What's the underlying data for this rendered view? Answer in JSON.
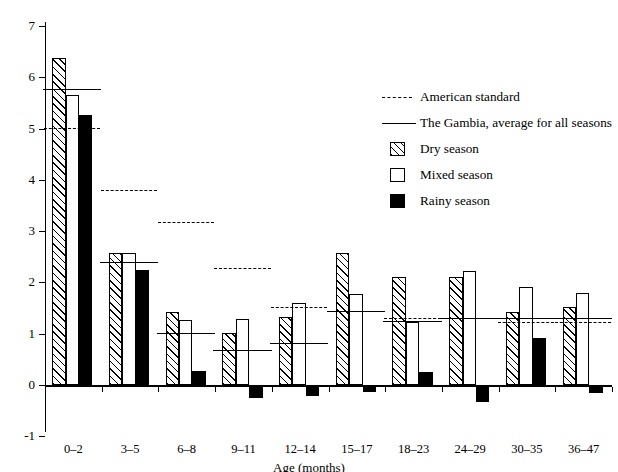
{
  "chart_data": {
    "type": "bar",
    "title": "",
    "subtitle": "",
    "xlabel": "Age (months)",
    "ylabel": "",
    "categories": [
      "0–2",
      "3–5",
      "6–8",
      "9–11",
      "12–14",
      "15–17",
      "18–23",
      "24–29",
      "30–35",
      "36–47"
    ],
    "ylim": [
      -1,
      7
    ],
    "yticks": [
      -1,
      0,
      1,
      2,
      3,
      4,
      5,
      6,
      7
    ],
    "ytick_labels": [
      "-1",
      "0",
      "1",
      "2",
      "3",
      "4",
      "5",
      "6",
      "7"
    ],
    "grid": false,
    "legend_position": "upper-right",
    "series": [
      {
        "name": "Dry season",
        "style": "hatched-diagonal",
        "values": [
          6.38,
          2.57,
          1.42,
          1.02,
          1.32,
          2.57,
          2.1,
          2.1,
          1.42,
          1.52
        ]
      },
      {
        "name": "Mixed season",
        "style": "open-white",
        "values": [
          5.65,
          2.57,
          1.27,
          1.29,
          1.59,
          1.78,
          1.22,
          2.22,
          1.92,
          1.8
        ]
      },
      {
        "name": "Rainy season",
        "style": "solid-black",
        "values": [
          5.27,
          2.24,
          0.28,
          -0.26,
          -0.21,
          -0.13,
          0.26,
          -0.33,
          0.92,
          -0.16
        ]
      }
    ],
    "reference_lines": [
      {
        "name": "American standard",
        "style": "dashed",
        "values": [
          5.02,
          3.8,
          3.17,
          2.28,
          1.52,
          1.45,
          1.3,
          1.3,
          1.22,
          1.22
        ]
      },
      {
        "name": "The Gambia, average for all seasons",
        "style": "solid",
        "values": [
          5.78,
          2.4,
          1.02,
          0.69,
          0.82,
          1.45,
          1.25,
          1.3,
          1.31,
          1.3
        ]
      }
    ],
    "legend": [
      {
        "label": "American standard",
        "marker": "dashed-line"
      },
      {
        "label": "The Gambia, average for all seasons",
        "marker": "solid-line"
      },
      {
        "label": "Dry season",
        "marker": "hatched-box"
      },
      {
        "label": "Mixed season",
        "marker": "open-box"
      },
      {
        "label": "Rainy season",
        "marker": "filled-box"
      }
    ]
  }
}
